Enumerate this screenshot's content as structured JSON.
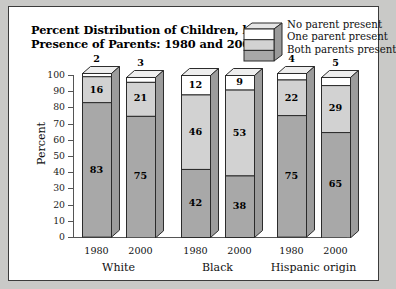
{
  "title": {
    "line1": "Percent Distribution of Children, by",
    "line2": "Presence of Parents: 1980 and 2000."
  },
  "legend": {
    "icon_name": "stacked-3d-box-icon",
    "entries": [
      {
        "label": "No parent present",
        "color": "#ffffff"
      },
      {
        "label": "One parent present",
        "color": "#d2d2d2"
      },
      {
        "label": "Both parents present",
        "color": "#a8a8a8"
      }
    ]
  },
  "axes": {
    "ylabel": "Percent",
    "yticks": [
      "100",
      "90",
      "80",
      "70",
      "60",
      "50",
      "40",
      "30",
      "20",
      "10",
      "0"
    ]
  },
  "groups": [
    {
      "name": "White",
      "years": [
        "1980",
        "2000"
      ]
    },
    {
      "name": "Black",
      "years": [
        "1980",
        "2000"
      ]
    },
    {
      "name": "Hispanic origin",
      "years": [
        "1980",
        "2000"
      ]
    }
  ],
  "chart_data": {
    "type": "bar",
    "title": "Percent Distribution of Children, by Presence of Parents: 1980 and 2000.",
    "xlabel": "",
    "ylabel": "Percent",
    "ylim": [
      0,
      100
    ],
    "grid": false,
    "stacked": true,
    "legend_position": "top-right",
    "categories": [
      "White 1980",
      "White 2000",
      "Black 1980",
      "Black 2000",
      "Hispanic origin 1980",
      "Hispanic origin 2000"
    ],
    "series": [
      {
        "name": "Both parents present",
        "color": "#a8a8a8",
        "values": [
          83,
          75,
          42,
          38,
          75,
          65
        ]
      },
      {
        "name": "One parent present",
        "color": "#d2d2d2",
        "values": [
          16,
          21,
          46,
          53,
          22,
          29
        ]
      },
      {
        "name": "No parent present",
        "color": "#ffffff",
        "values": [
          2,
          3,
          12,
          9,
          4,
          5
        ]
      }
    ]
  }
}
